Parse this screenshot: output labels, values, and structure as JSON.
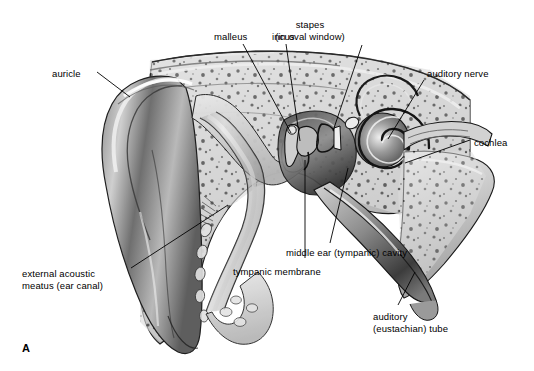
{
  "figure": {
    "panel_letter": "A",
    "background_color": "#ffffff",
    "ink_color": "#000000"
  },
  "labels": [
    {
      "id": "auricle",
      "text": "auricle",
      "x": 52,
      "y": 68,
      "align": "left"
    },
    {
      "id": "malleus",
      "text": "malleus",
      "x": 214,
      "y": 31,
      "align": "left"
    },
    {
      "id": "incus",
      "text": "incus",
      "x": 272,
      "y": 31,
      "align": "left"
    },
    {
      "id": "stapes",
      "text": "stapes\n(in oval window)",
      "x": 310,
      "y": 19,
      "align": "center"
    },
    {
      "id": "auditory-nerve",
      "text": "auditory nerve",
      "x": 427,
      "y": 68,
      "align": "left"
    },
    {
      "id": "cochlea",
      "text": "cochlea",
      "x": 474,
      "y": 137,
      "align": "left"
    },
    {
      "id": "middle-ear-cavity",
      "text": "middle ear (tympanic) cavity",
      "x": 286,
      "y": 247,
      "align": "left"
    },
    {
      "id": "tympanic-membrane",
      "text": "tympanic membrane",
      "x": 233,
      "y": 266,
      "align": "left"
    },
    {
      "id": "external-acoustic-meatus",
      "text": "external acoustic\nmeatus (ear canal)",
      "x": 22,
      "y": 268,
      "align": "left"
    },
    {
      "id": "auditory-tube",
      "text": "auditory\n(eustachian) tube",
      "x": 373,
      "y": 311,
      "align": "left"
    }
  ],
  "leader_lines": [
    {
      "id": "auricle-leader",
      "points": "97,72 130,97"
    },
    {
      "id": "malleus-leader",
      "points": "243,44 291,133"
    },
    {
      "id": "incus-leader",
      "points": "286,44 300,141"
    },
    {
      "id": "stapes-leader",
      "points": "362,45 333,131"
    },
    {
      "id": "auditory-nerve-leader",
      "points": "424,80 388,139"
    },
    {
      "id": "cochlea-leader",
      "points": "470,140 405,163"
    },
    {
      "id": "middle-ear-cavity-leader",
      "points": "330,243 348,168"
    },
    {
      "id": "tympanic-membrane-leader",
      "points": "305,258 305,160"
    },
    {
      "id": "external-acoustic-meatus-leader",
      "points": "131,268 228,205"
    },
    {
      "id": "auditory-tube-leader",
      "points": "398,305 415,272"
    }
  ],
  "anatomy": {
    "structures": [
      {
        "id": "auricle",
        "name": "auricle (pinna)"
      },
      {
        "id": "external-acoustic-meatus",
        "name": "external acoustic meatus (ear canal)"
      },
      {
        "id": "tympanic-membrane",
        "name": "tympanic membrane (eardrum)"
      },
      {
        "id": "malleus",
        "name": "malleus"
      },
      {
        "id": "incus",
        "name": "incus"
      },
      {
        "id": "stapes",
        "name": "stapes in oval window"
      },
      {
        "id": "middle-ear-cavity",
        "name": "middle ear (tympanic) cavity"
      },
      {
        "id": "cochlea",
        "name": "cochlea"
      },
      {
        "id": "auditory-nerve",
        "name": "auditory nerve"
      },
      {
        "id": "auditory-tube",
        "name": "auditory (eustachian) tube"
      },
      {
        "id": "temporal-bone",
        "name": "temporal bone (cancellous)"
      }
    ]
  }
}
